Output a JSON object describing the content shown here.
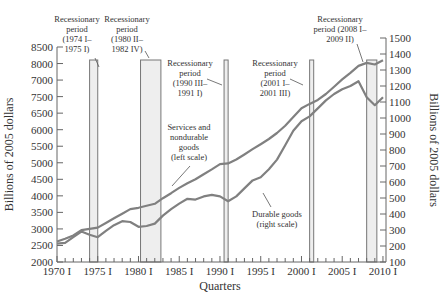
{
  "chart_data": {
    "type": "line",
    "title": "",
    "xlabel": "Quarters",
    "ylabel_left": "Billions of 2005 dollars",
    "ylabel_right": "Billions of 2005 dollars",
    "x_tick_labels": [
      "1970 I",
      "1975 I",
      "1980 I",
      "1985 I",
      "1990 I",
      "1995 I",
      "2000 I",
      "2005 I",
      "2010 I"
    ],
    "x_tick_years": [
      1970,
      1975,
      1980,
      1985,
      1990,
      1995,
      2000,
      2005,
      2010
    ],
    "xlim": [
      1970,
      2010.25
    ],
    "left_axis": {
      "tick_labels": [
        "8500",
        "8000",
        "7000",
        "7500",
        "6500",
        "6000",
        "5500",
        "5000",
        "4500",
        "4000",
        "3500",
        "3000",
        "2500",
        "2000"
      ],
      "ylim": [
        2000,
        8500
      ]
    },
    "right_axis": {
      "tick_labels": [
        "1500",
        "1400",
        "1300",
        "1200",
        "1100",
        "1000",
        "900",
        "800",
        "700",
        "600",
        "500",
        "400",
        "300",
        "200",
        "100"
      ],
      "ylim": [
        100,
        1500
      ]
    },
    "grid": false,
    "series": [
      {
        "name": "Services and nondurable goods (left scale)",
        "axis": "left",
        "x": [
          1970,
          1971,
          1972,
          1973,
          1974,
          1975,
          1976,
          1977,
          1978,
          1979,
          1980,
          1981,
          1982,
          1983,
          1984,
          1985,
          1986,
          1987,
          1988,
          1989,
          1990,
          1991,
          1992,
          1993,
          1994,
          1995,
          1996,
          1997,
          1998,
          1999,
          2000,
          2001,
          2002,
          2003,
          2004,
          2005,
          2006,
          2007,
          2008,
          2009,
          2010
        ],
        "values": [
          2620,
          2700,
          2800,
          2960,
          3000,
          3040,
          3180,
          3320,
          3460,
          3600,
          3640,
          3700,
          3760,
          3930,
          4080,
          4240,
          4380,
          4500,
          4650,
          4800,
          4960,
          4980,
          5100,
          5250,
          5410,
          5560,
          5720,
          5900,
          6120,
          6380,
          6650,
          6780,
          6900,
          7080,
          7300,
          7520,
          7720,
          7930,
          8020,
          7970,
          8100
        ]
      },
      {
        "name": "Durable goods (right scale)",
        "axis": "right",
        "x": [
          1970,
          1971,
          1972,
          1973,
          1974,
          1975,
          1976,
          1977,
          1978,
          1979,
          1980,
          1981,
          1982,
          1983,
          1984,
          1985,
          1986,
          1987,
          1988,
          1989,
          1990,
          1991,
          1992,
          1993,
          1994,
          1995,
          1996,
          1997,
          1998,
          1999,
          2000,
          2001,
          2002,
          2003,
          2004,
          2005,
          2006,
          2007,
          2008,
          2009,
          2010
        ],
        "values": [
          215,
          220,
          255,
          290,
          270,
          255,
          295,
          330,
          355,
          350,
          320,
          325,
          340,
          390,
          430,
          465,
          495,
          490,
          510,
          520,
          510,
          480,
          510,
          560,
          610,
          630,
          680,
          740,
          830,
          920,
          980,
          1010,
          1060,
          1110,
          1150,
          1180,
          1200,
          1230,
          1130,
          1080,
          1130
        ]
      }
    ],
    "recessions": [
      {
        "label": "Recessionary period (1974 I– 1975 I)",
        "lines": [
          "Recessionary",
          "period",
          "(1974 I–",
          "1975 I)"
        ],
        "start": 1974.0,
        "end": 1975.0
      },
      {
        "label": "Recessionary period (1980 II– 1982 IV)",
        "lines": [
          "Recessionary",
          "period",
          "(1980 II–",
          "1982 IV)"
        ],
        "start": 1980.25,
        "end": 1982.75
      },
      {
        "label": "Recessionary period (1990 III– 1991 I)",
        "lines": [
          "Recessionary",
          "period",
          "(1990 III–",
          "1991 I)"
        ],
        "start": 1990.5,
        "end": 1991.0
      },
      {
        "label": "Recessionary period (2001 I– 2001 III)",
        "lines": [
          "Recessionary",
          "period",
          "(2001 I–",
          "2001 III)"
        ],
        "start": 2001.0,
        "end": 2001.5
      },
      {
        "label": "Recessionary period (2008 I– 2009 II)",
        "lines": [
          "Recessionary",
          "period (2008 I–",
          "2009 II)"
        ],
        "start": 2008.0,
        "end": 2009.25
      }
    ],
    "annotations": [
      {
        "text_lines": [
          "Services and",
          "nondurable",
          "goods",
          "(left scale)"
        ]
      },
      {
        "text_lines": [
          "Durable goods",
          "(right scale)"
        ]
      }
    ],
    "legend": "none (inline annotations)"
  }
}
